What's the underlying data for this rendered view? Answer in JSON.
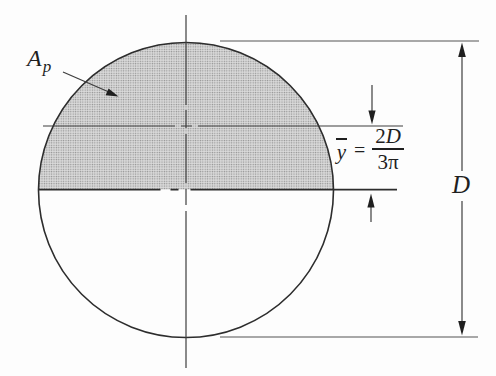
{
  "figure": {
    "labels": {
      "area": {
        "base": "A",
        "sub": "p"
      },
      "centroid": {
        "var": "y",
        "equals": "=",
        "num_coeff": "2",
        "num_var": "D",
        "den_coeff": "3",
        "den_sym": "π"
      },
      "diameter": "D"
    },
    "colors": {
      "ink": "#2d2d2d",
      "line": "#4a4a4a",
      "shading_dot": "#8f8f8f",
      "shading_bg": "#dbdbdb",
      "background": "#fdfdfd"
    }
  }
}
